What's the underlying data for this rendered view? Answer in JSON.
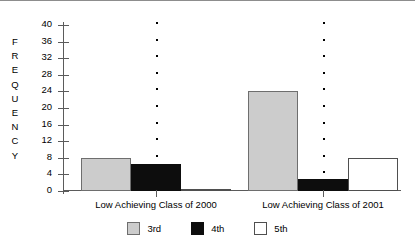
{
  "chart_data": {
    "type": "bar",
    "title": "",
    "xlabel": "",
    "ylabel": "FREQUENCY",
    "ylim": [
      0,
      40
    ],
    "yticks": [
      0,
      4,
      8,
      12,
      16,
      20,
      24,
      28,
      32,
      36,
      40
    ],
    "grid": false,
    "legend_position": "bottom",
    "categories": [
      "Low Achieving Class of 2000",
      "Low Achieving Class of 2001"
    ],
    "series": [
      {
        "name": "3rd",
        "color": "#cccccc",
        "values": [
          8,
          24
        ]
      },
      {
        "name": "4th",
        "color": "#0d0d0d",
        "values": [
          6.5,
          3
        ]
      },
      {
        "name": "5th",
        "color": "#ffffff",
        "values": [
          0.3,
          8
        ]
      }
    ]
  },
  "axis": {
    "y_title_letters": [
      "F",
      "R",
      "E",
      "Q",
      "U",
      "E",
      "N",
      "C",
      "Y"
    ],
    "tick_labels": [
      "40",
      "36",
      "32",
      "28",
      "24",
      "20",
      "16",
      "12",
      "8",
      "4",
      "0"
    ]
  },
  "legend": {
    "items": [
      {
        "label": "3rd",
        "swatch": "gray-swatch"
      },
      {
        "label": "4th",
        "swatch": "black-swatch"
      },
      {
        "label": "5th",
        "swatch": "white-swatch"
      }
    ]
  }
}
